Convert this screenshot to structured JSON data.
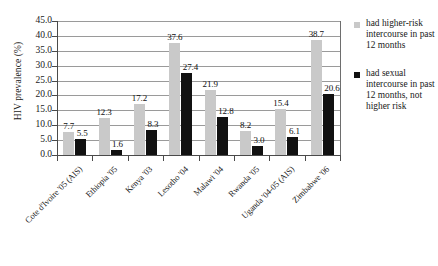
{
  "chart_data": {
    "type": "bar",
    "title": "",
    "xlabel": "",
    "ylabel": "HIV prevalence (%)",
    "ylim": [
      0,
      45
    ],
    "ytick_step": 5,
    "grid": true,
    "legend_position": "right",
    "categories": [
      "Cote d'Ivoire '05 (AIS)",
      "Ethiopia '05",
      "Kenya '03",
      "Lesotho '04",
      "Malawi '04",
      "Rwanda '05",
      "Uganda '04-05 (AIS)",
      "Zimbabwe '06"
    ],
    "ytick_labels": [
      "0.0",
      "5.0",
      "10.0",
      "15.0",
      "20.0",
      "25.0",
      "30.0",
      "35.0",
      "40.0",
      "45.0"
    ],
    "series": [
      {
        "name": "had higher-risk intercourse in past 12 months",
        "color": "#c9c9c9",
        "values": [
          7.7,
          12.3,
          17.2,
          37.6,
          21.9,
          8.2,
          15.4,
          38.7
        ],
        "labels": [
          "7.7",
          "12.3",
          "17.2",
          "37.6",
          "21.9",
          "8.2",
          "15.4",
          "38.7"
        ]
      },
      {
        "name": "had sexual intercourse in past 12 months, not higher risk",
        "color": "#111111",
        "values": [
          5.5,
          1.6,
          8.3,
          27.4,
          12.8,
          3.0,
          6.1,
          20.6
        ],
        "labels": [
          "5.5",
          "1.6",
          "8.3",
          "27.4",
          "12.8",
          "3.0",
          "6.1",
          "20.6"
        ]
      }
    ]
  },
  "legend": {
    "entries": [
      {
        "label": "had higher-risk intercourse in past 12 months",
        "swatch": "series-a"
      },
      {
        "label": "had sexual intercourse in past 12 months, not higher risk",
        "swatch": "series-b"
      }
    ]
  }
}
